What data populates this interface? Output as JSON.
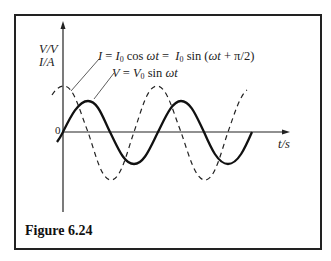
{
  "figure": {
    "caption": "Figure 6.24",
    "y_axis_label_1": "V/V",
    "y_axis_label_2": "I/A",
    "x_axis_label": "t/s",
    "origin_label": "0",
    "current_equation": "I = I0 cos ωt = I0 sin (ωt + π/2)",
    "voltage_equation": "V = V0 sin ωt"
  },
  "curves": [
    {
      "name": "voltage",
      "style": "solid",
      "expression": "V = V0 sin ωt",
      "cycles_shown": 2
    },
    {
      "name": "current",
      "style": "dashed",
      "expression": "I = I0 cos ωt",
      "phase_lead": "π/2"
    }
  ]
}
